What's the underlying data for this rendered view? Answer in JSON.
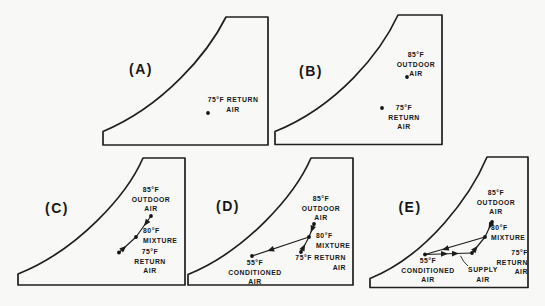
{
  "figure": {
    "colors": {
      "ink": "#1c1c1c",
      "background": "#f8f8f6"
    },
    "panels": [
      {
        "label": "(A)",
        "points": [
          {
            "name": "return-air",
            "text": "75°F RETURN\nAIR"
          }
        ]
      },
      {
        "label": "(B)",
        "points": [
          {
            "name": "outdoor-air",
            "text": "85°F\nOUTDOOR\nAIR"
          },
          {
            "name": "return-air",
            "text": "75°F\nRETURN\nAIR"
          }
        ]
      },
      {
        "label": "(C)",
        "points": [
          {
            "name": "outdoor-air",
            "text": "85°F\nOUTDOOR\nAIR"
          },
          {
            "name": "mixture",
            "text": "80°F\nMIXTURE"
          },
          {
            "name": "return-air",
            "text": "75°F\nRETURN\nAIR"
          }
        ]
      },
      {
        "label": "(D)",
        "points": [
          {
            "name": "outdoor-air",
            "text": "85°F\nOUTDOOR\nAIR"
          },
          {
            "name": "mixture",
            "text": "80°F\nMIXTURE"
          },
          {
            "name": "return-air",
            "text": "75°F RETURN\nAIR"
          },
          {
            "name": "conditioned-air",
            "text": "55°F\nCONDITIONED\nAIR"
          }
        ]
      },
      {
        "label": "(E)",
        "points": [
          {
            "name": "outdoor-air",
            "text": "85°F\nOUTDOOR\nAIR"
          },
          {
            "name": "mixture",
            "text": "80°F\nMIXTURE"
          },
          {
            "name": "return-air",
            "text": "75°F RETURN\nAIR"
          },
          {
            "name": "conditioned-air",
            "text": "55°F\nCONDITIONED\nAIR"
          },
          {
            "name": "supply-air",
            "text": "SUPPLY\nAIR"
          }
        ]
      }
    ]
  }
}
